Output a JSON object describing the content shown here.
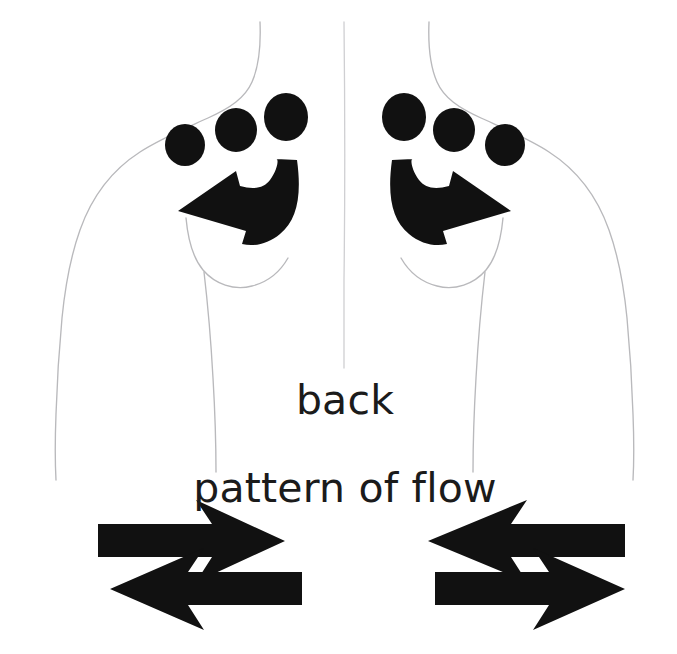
{
  "figure": {
    "title": "back",
    "subtitle": "pattern of flow",
    "view": "back",
    "background_color": "#ffffff",
    "ink_color": "#111111",
    "outline_color": "#b9b9bc",
    "text_color": "#1b1b1b"
  },
  "labels": {
    "back": "back",
    "pattern_of_flow": "pattern of flow"
  },
  "nodes": {
    "description": "lymph node groups marked as filled dots over each shoulder / upper back",
    "left_side": [
      {
        "id": "left-node-1",
        "cx": 185,
        "cy": 145,
        "rx": 20,
        "ry": 21
      },
      {
        "id": "left-node-2",
        "cx": 236,
        "cy": 130,
        "rx": 21,
        "ry": 22
      },
      {
        "id": "left-node-3",
        "cx": 286,
        "cy": 117,
        "rx": 22,
        "ry": 24
      }
    ],
    "right_side": [
      {
        "id": "right-node-1",
        "cx": 404,
        "cy": 117,
        "rx": 22,
        "ry": 24
      },
      {
        "id": "right-node-2",
        "cx": 454,
        "cy": 130,
        "rx": 21,
        "ry": 22
      },
      {
        "id": "right-node-3",
        "cx": 505,
        "cy": 145,
        "rx": 20,
        "ry": 21
      }
    ]
  },
  "flow_arrows": {
    "curved": [
      {
        "id": "left-curved-arrow",
        "direction": "left",
        "shape": "hooked-curve-with-arrowhead"
      },
      {
        "id": "right-curved-arrow",
        "direction": "right",
        "shape": "hooked-curve-with-arrowhead"
      }
    ],
    "straight_left_pair": [
      {
        "id": "left-arrow-upper",
        "direction": "right",
        "y": 540
      },
      {
        "id": "left-arrow-lower",
        "direction": "left",
        "y": 588
      }
    ],
    "straight_right_pair": [
      {
        "id": "right-arrow-upper",
        "direction": "left",
        "y": 540
      },
      {
        "id": "right-arrow-lower",
        "direction": "right",
        "y": 588
      }
    ]
  }
}
